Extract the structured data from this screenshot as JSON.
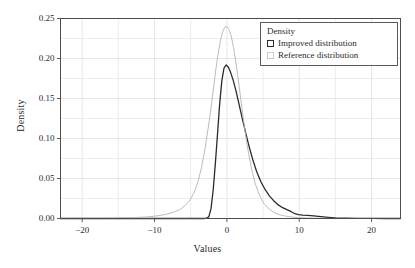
{
  "chart_data": {
    "type": "line",
    "title": "",
    "xlabel": "Values",
    "ylabel": "Density",
    "xlim": [
      -23,
      24
    ],
    "ylim": [
      0.0,
      0.25
    ],
    "grid": true,
    "legend_position": "top-right",
    "legend_title": "Density",
    "xticks": [
      -20,
      -10,
      0,
      10,
      20
    ],
    "xtick_labels": [
      "−20",
      "−10",
      "0",
      "10",
      "20"
    ],
    "yticks": [
      0.0,
      0.05,
      0.1,
      0.15,
      0.2,
      0.25
    ],
    "ytick_labels": [
      "0.00",
      "0.05",
      "0.10",
      "0.15",
      "0.20",
      "0.25"
    ],
    "minor_xticks": [
      -15,
      -5,
      5,
      15
    ],
    "minor_yticks": [
      0.025,
      0.075,
      0.125,
      0.175,
      0.225
    ],
    "series": [
      {
        "name": "Improved distribution",
        "color": "#2b2b2b",
        "swatch_color": "#2b2b2b",
        "x": [
          -23,
          -3.2,
          -2.8,
          -2.5,
          -2.2,
          -1.9,
          -1.6,
          -1.3,
          -1.0,
          -0.7,
          -0.4,
          -0.1,
          0.2,
          0.5,
          0.9,
          1.3,
          1.7,
          2.1,
          2.6,
          3.1,
          3.6,
          4.1,
          4.7,
          5.3,
          5.9,
          6.5,
          7.1,
          7.7,
          8.3,
          8.9,
          9.4,
          9.9,
          10.5,
          11.2,
          12.0,
          13.0,
          14.0,
          15.0,
          16.5,
          18.0,
          20.0,
          22.0,
          24
        ],
        "y": [
          0.0,
          0.0,
          0.0005,
          0.002,
          0.012,
          0.035,
          0.068,
          0.105,
          0.143,
          0.172,
          0.188,
          0.192,
          0.189,
          0.183,
          0.172,
          0.158,
          0.142,
          0.126,
          0.107,
          0.089,
          0.073,
          0.059,
          0.046,
          0.036,
          0.028,
          0.022,
          0.017,
          0.0135,
          0.011,
          0.0085,
          0.006,
          0.0048,
          0.0042,
          0.0038,
          0.0032,
          0.0024,
          0.0015,
          0.0008,
          0.0004,
          0.0002,
          0.0001,
          0.0,
          0.0
        ]
      },
      {
        "name": "Reference distribution",
        "color": "#b4b4b4",
        "swatch_color": "#cccccc",
        "x": [
          -23,
          -18,
          -15,
          -13,
          -11,
          -9.5,
          -8.5,
          -7.5,
          -6.5,
          -5.8,
          -5.1,
          -4.5,
          -4.0,
          -3.5,
          -3.0,
          -2.6,
          -2.2,
          -1.8,
          -1.5,
          -1.2,
          -0.9,
          -0.6,
          -0.3,
          0.0,
          0.3,
          0.6,
          0.9,
          1.2,
          1.6,
          2.0,
          2.4,
          2.9,
          3.4,
          3.9,
          4.5,
          5.1,
          5.8,
          6.5,
          7.2,
          8.0,
          9.0,
          10.0,
          11.5,
          13.0,
          15.0,
          18.0,
          21.0,
          24
        ],
        "y": [
          0.0,
          0.0002,
          0.0005,
          0.001,
          0.002,
          0.0035,
          0.005,
          0.0075,
          0.011,
          0.016,
          0.023,
          0.033,
          0.046,
          0.064,
          0.088,
          0.112,
          0.138,
          0.166,
          0.188,
          0.206,
          0.222,
          0.233,
          0.239,
          0.24,
          0.236,
          0.228,
          0.215,
          0.198,
          0.172,
          0.144,
          0.116,
          0.086,
          0.062,
          0.044,
          0.029,
          0.019,
          0.012,
          0.0075,
          0.005,
          0.0032,
          0.0018,
          0.001,
          0.0005,
          0.0003,
          0.0001,
          0.0,
          0.0,
          0.0
        ]
      }
    ]
  },
  "legend": {
    "title": "Density",
    "entries": [
      {
        "label": "Improved distribution"
      },
      {
        "label": "Reference distribution"
      }
    ]
  },
  "colors": {
    "background": "#ffffff",
    "axis": "#4d4d4d",
    "grid": "#e0e0e0",
    "text": "#2b2b2b",
    "improved": "#2b2b2b",
    "reference": "#b4b4b4"
  }
}
